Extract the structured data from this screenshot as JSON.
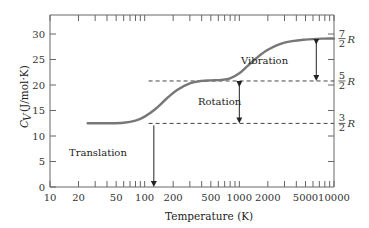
{
  "chart_data": {
    "type": "line",
    "title": "",
    "xlabel": "Temperature (K)",
    "ylabel": "C_V (J/mol·K)",
    "xscale": "log",
    "xlim": [
      10,
      10000
    ],
    "ylim": [
      0,
      33
    ],
    "grid": false,
    "x_ticks": [
      "10",
      "20",
      "50",
      "100",
      "200",
      "500",
      "1000",
      "2000",
      "5000",
      "10000"
    ],
    "y_ticks": [
      "0",
      "5",
      "10",
      "15",
      "20",
      "25",
      "30"
    ],
    "right_axis_labels": [
      {
        "num": "3",
        "den": "2",
        "sym": "R",
        "value": 12.47
      },
      {
        "num": "5",
        "den": "2",
        "sym": "R",
        "value": 20.79
      },
      {
        "num": "7",
        "den": "2",
        "sym": "R",
        "value": 29.1
      }
    ],
    "series": [
      {
        "name": "C_V of H2",
        "color": "#777777",
        "x": [
          25,
          40,
          60,
          80,
          100,
          130,
          170,
          220,
          300,
          400,
          500,
          650,
          800,
          1000,
          1200,
          1500,
          2000,
          3000,
          5000,
          8000,
          10000
        ],
        "y": [
          12.5,
          12.5,
          12.6,
          13.0,
          13.8,
          15.3,
          17.3,
          19.0,
          20.3,
          20.8,
          20.9,
          21.0,
          21.3,
          22.3,
          23.6,
          25.2,
          26.9,
          28.3,
          28.9,
          29.1,
          29.1
        ]
      }
    ],
    "annotations": [
      {
        "text": "Translation",
        "arrow_x": 125,
        "from": 0,
        "to": 12.47
      },
      {
        "text": "Rotation",
        "arrow_x": 1000,
        "from": 12.47,
        "to": 20.79
      },
      {
        "text": "Vibration",
        "arrow_x": 6500,
        "from": 20.79,
        "to": 29.1
      }
    ],
    "reference_lines": [
      {
        "y": 12.47,
        "style": "dashed",
        "label": "3/2 R"
      },
      {
        "y": 20.79,
        "style": "dashed",
        "label": "5/2 R"
      }
    ]
  },
  "labels": {
    "xlabel": "Temperature (K)",
    "ylabel_main": "C",
    "ylabel_sub": "V",
    "ylabel_units": "(J/mol·K)",
    "translation": "Translation",
    "rotation": "Rotation",
    "vibration": "Vibration",
    "R": "R"
  }
}
